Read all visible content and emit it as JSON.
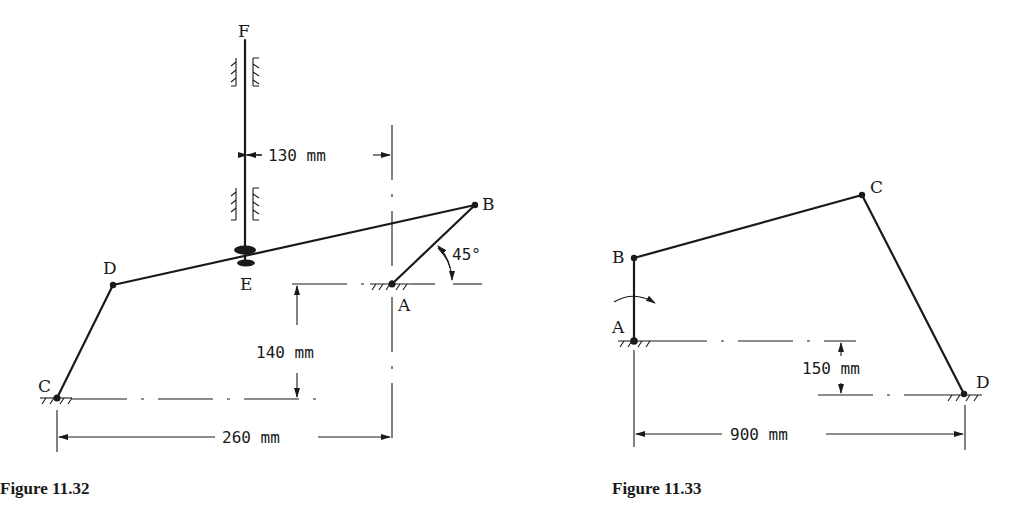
{
  "figures": [
    {
      "id": "fig-11-32",
      "caption": "Figure 11.32",
      "labels": {
        "F": "F",
        "B": "B",
        "D": "D",
        "E": "E",
        "A": "A",
        "C": "C"
      },
      "dimensions": {
        "horizontal_top": "130 mm",
        "vertical": "140 mm",
        "horizontal_bottom": "260 mm",
        "angle": "45°"
      }
    },
    {
      "id": "fig-11-33",
      "caption": "Figure 11.33",
      "labels": {
        "A": "A",
        "B": "B",
        "C": "C",
        "D": "D"
      },
      "dimensions": {
        "vertical": "150 mm",
        "horizontal": "900 mm"
      }
    }
  ],
  "colors": {
    "ink": "#1a1a1a",
    "background": "#ffffff"
  }
}
